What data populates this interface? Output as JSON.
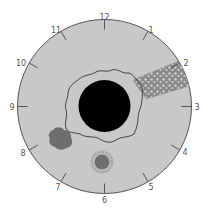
{
  "diagram": {
    "colors": {
      "background": "#ffffff",
      "field": "#c8c8c8",
      "outline": "#555555",
      "disc": "#000000",
      "lesion": "#6e6e6e",
      "label": "#555555"
    },
    "clock_labels": [
      "12",
      "1",
      "2",
      "3",
      "4",
      "5",
      "6",
      "7",
      "8",
      "9",
      "10",
      "11"
    ],
    "features": [
      {
        "name": "central-dark-disc",
        "shape": "circle"
      },
      {
        "name": "irregular-border-ring",
        "shape": "wavy-outline"
      },
      {
        "name": "mottled-band-at-2-oclock",
        "shape": "speckled-band"
      },
      {
        "name": "blotch-at-8-oclock",
        "shape": "irregular-blob"
      },
      {
        "name": "spiky-spot-at-6-oclock",
        "shape": "fuzzy-circle"
      }
    ]
  }
}
